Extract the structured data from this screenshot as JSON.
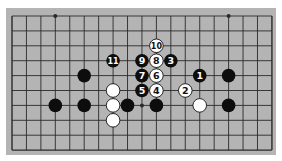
{
  "diagram": {
    "type": "go-board-fragment",
    "colors": {
      "board": "#b4b4b4",
      "line": "#2a2a2a",
      "black": "#0d0d0d",
      "white": "#ffffff"
    },
    "grid": {
      "cols": 19,
      "rows": 10,
      "x0": 12,
      "y0": 16,
      "dx": 14.44,
      "dy": 14.9
    },
    "star_points": [
      [
        3,
        0
      ],
      [
        15,
        0
      ],
      [
        9,
        6
      ]
    ],
    "stones": [
      {
        "col": 13,
        "row": 4,
        "color": "black",
        "label": "1"
      },
      {
        "col": 12,
        "row": 5,
        "color": "white",
        "label": "2"
      },
      {
        "col": 11,
        "row": 3,
        "color": "black",
        "label": "3"
      },
      {
        "col": 10,
        "row": 5,
        "color": "white",
        "label": "4"
      },
      {
        "col": 9,
        "row": 5,
        "color": "black",
        "label": "5"
      },
      {
        "col": 10,
        "row": 4,
        "color": "white",
        "label": "6"
      },
      {
        "col": 9,
        "row": 4,
        "color": "black",
        "label": "7"
      },
      {
        "col": 10,
        "row": 3,
        "color": "white",
        "label": "8"
      },
      {
        "col": 9,
        "row": 3,
        "color": "black",
        "label": "9"
      },
      {
        "col": 10,
        "row": 2,
        "color": "white",
        "label": "10"
      },
      {
        "col": 7,
        "row": 3,
        "color": "black",
        "label": "11"
      },
      {
        "col": 5,
        "row": 4,
        "color": "black",
        "label": ""
      },
      {
        "col": 15,
        "row": 4,
        "color": "black",
        "label": ""
      },
      {
        "col": 7,
        "row": 5,
        "color": "white",
        "label": ""
      },
      {
        "col": 3,
        "row": 6,
        "color": "black",
        "label": ""
      },
      {
        "col": 5,
        "row": 6,
        "color": "black",
        "label": ""
      },
      {
        "col": 7,
        "row": 6,
        "color": "white",
        "label": ""
      },
      {
        "col": 8,
        "row": 6,
        "color": "black",
        "label": ""
      },
      {
        "col": 10,
        "row": 6,
        "color": "black",
        "label": ""
      },
      {
        "col": 13,
        "row": 6,
        "color": "white",
        "label": ""
      },
      {
        "col": 15,
        "row": 6,
        "color": "black",
        "label": ""
      },
      {
        "col": 7,
        "row": 7,
        "color": "white",
        "label": ""
      }
    ]
  }
}
